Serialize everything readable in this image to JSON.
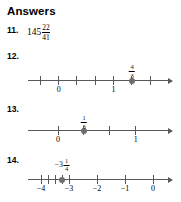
{
  "header": {
    "title": "Answers"
  },
  "items": [
    {
      "number": "11.",
      "type": "fraction_answer",
      "whole": "145",
      "numerator": "22",
      "denominator": "41"
    },
    {
      "number": "12.",
      "type": "numberline",
      "point_label": {
        "whole": "",
        "numerator": "4",
        "denominator": "3",
        "sign": ""
      },
      "axis_labels": [
        "0",
        "1"
      ],
      "axis_label_values": [
        0,
        1
      ],
      "point_value": 1.3333,
      "tick_values": [
        -0.3333,
        0,
        0.3333,
        0.6667,
        1.0,
        1.3333,
        1.6667
      ],
      "axis_min": -0.55,
      "axis_max": 2.0
    },
    {
      "number": "13.",
      "type": "numberline",
      "point_label": {
        "whole": "",
        "numerator": "1",
        "denominator": "3",
        "sign": ""
      },
      "axis_labels": [
        "0",
        "1"
      ],
      "axis_label_values": [
        0,
        1
      ],
      "point_value": 0.3333,
      "tick_values": [
        0,
        0.3333,
        0.6667,
        1.0
      ],
      "axis_min": -0.38,
      "axis_max": 1.42
    },
    {
      "number": "14.",
      "type": "numberline",
      "point_label": {
        "whole": "3",
        "numerator": "1",
        "denominator": "4",
        "sign": "−"
      },
      "axis_labels": [
        "−4",
        "−3",
        "−2",
        "−1",
        "0"
      ],
      "axis_label_values": [
        -4,
        -3,
        -2,
        -1,
        0
      ],
      "point_value": -3.25,
      "tick_values": [
        -4,
        -3.75,
        -3.5,
        -3.25,
        -3,
        -2,
        -1,
        0
      ],
      "axis_min": -4.45,
      "axis_max": 0.55
    }
  ],
  "colors": {
    "axis": "#58585a",
    "dot": "#6d6e71",
    "text": "#000000",
    "background": "#ffffff"
  }
}
